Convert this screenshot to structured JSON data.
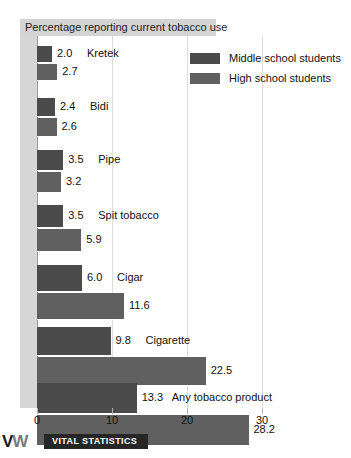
{
  "chart_data": {
    "type": "bar",
    "title": "Percentage reporting current tobacco use",
    "orientation": "horizontal",
    "xlabel": "",
    "ylabel": "",
    "xlim": [
      0,
      33
    ],
    "xticks": [
      0,
      10,
      20,
      30
    ],
    "xtick_labels": [
      "0",
      "10",
      "20",
      "30"
    ],
    "grid": true,
    "legend_position": "top-right",
    "categories": [
      "Kretek",
      "Bidi",
      "Pipe",
      "Spit tobacco",
      "Cigar",
      "Cigarette",
      "Any tobacco product"
    ],
    "series": [
      {
        "name": "Middle school students",
        "color": "#4b4b4b",
        "values": [
          2.0,
          2.4,
          3.5,
          3.5,
          6.0,
          9.8,
          13.3
        ],
        "labels": [
          "2.0",
          "2.4",
          "3.5",
          "3.5",
          "6.0",
          "9.8",
          "13.3"
        ]
      },
      {
        "name": "High school students",
        "color": "#606060",
        "values": [
          2.7,
          2.6,
          3.2,
          5.9,
          11.6,
          22.5,
          28.2
        ],
        "labels": [
          "2.7",
          "2.6",
          "3.2",
          "5.9",
          "11.6",
          "22.5",
          "28.2"
        ]
      }
    ]
  },
  "legend": {
    "items": [
      {
        "label": "Middle school students",
        "swatch": "ms"
      },
      {
        "label": "High school students",
        "swatch": "hs"
      }
    ]
  },
  "footer": {
    "logo_v": "V",
    "logo_w": "W",
    "band_text": "VITAL STATISTICS"
  }
}
